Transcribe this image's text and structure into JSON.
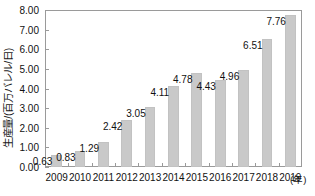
{
  "chart_data": {
    "type": "bar",
    "title": "",
    "subtitle": "",
    "xlabel": "(年)",
    "ylabel": "生産量/(百万バレル/日)",
    "categories": [
      "2009",
      "2010",
      "2011",
      "2012",
      "2013",
      "2014",
      "2015",
      "2016",
      "2017",
      "2018",
      "2019"
    ],
    "values": [
      0.63,
      0.83,
      1.29,
      2.42,
      3.05,
      4.11,
      4.78,
      4.43,
      4.96,
      6.51,
      7.76
    ],
    "value_labels": [
      "0.63",
      "0.83",
      "1.29",
      "2.42",
      "3.05",
      "4.11",
      "4.78",
      "4.43",
      "4.96",
      "6.51",
      "7.76"
    ],
    "ylim": [
      0,
      8
    ],
    "ytick_values": [
      0,
      1,
      2,
      3,
      4,
      5,
      6,
      7,
      8
    ],
    "ytick_labels": [
      "0.00",
      "1.00",
      "2.00",
      "3.00",
      "4.00",
      "5.00",
      "6.00",
      "7.00",
      "8.00"
    ],
    "grid": false,
    "legend": null,
    "bar_color": "#c9c9c9",
    "axis_color": "#9a9a9a",
    "text_color": "#111111"
  }
}
